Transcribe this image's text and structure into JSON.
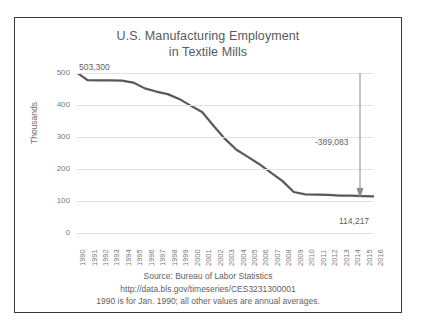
{
  "figure": {
    "title_line_1": "U.S. Manufacturing Employment",
    "title_line_2": "in Textile Mills",
    "border_color": "#3a3a3a",
    "background": "#ffffff"
  },
  "annotations": {
    "start_value_label": "503,300",
    "delta_label": "-389,083",
    "end_value_label": "114,217",
    "arrow_name": "decline-arrow"
  },
  "footnotes": [
    "Source:  Bureau of Labor Statistics",
    "http://data.bls.gov/timeseries/CES3231300001",
    "1990 is for Jan. 1990; all other values are annual averages."
  ],
  "chart_data": {
    "type": "line",
    "title": "U.S. Manufacturing Employment in Textile Mills",
    "xlabel": "",
    "ylabel": "Thousands",
    "ylim": [
      0,
      500
    ],
    "yticks": [
      0,
      100,
      200,
      300,
      400,
      500
    ],
    "ytick_labels": [
      "0",
      "100",
      "200",
      "300",
      "400",
      "500"
    ],
    "grid": true,
    "legend": false,
    "line_color": "#595959",
    "line_width": 2.2,
    "categories": [
      "1990",
      "1991",
      "1992",
      "1993",
      "1994",
      "1995",
      "1996",
      "1997",
      "1998",
      "1999",
      "2000",
      "2001",
      "2002",
      "2003",
      "2004",
      "2005",
      "2006",
      "2007",
      "2008",
      "2009",
      "2010",
      "2011",
      "2012",
      "2013",
      "2014",
      "2015",
      "2016"
    ],
    "values": [
      503.3,
      478.0,
      477.0,
      477.0,
      476.0,
      470.0,
      452.0,
      442.0,
      434.0,
      419.0,
      398.0,
      378.0,
      335.0,
      294.0,
      260.0,
      238.0,
      215.0,
      189.0,
      163.0,
      128.0,
      120.5,
      120.0,
      119.0,
      117.0,
      117.0,
      115.5,
      114.2
    ],
    "annotations": [
      {
        "name": "start-value",
        "text": "503,300",
        "at_category": "1990",
        "value": 503.3
      },
      {
        "name": "end-value",
        "text": "114,217",
        "at_category": "2016",
        "value": 114.217
      },
      {
        "name": "total-change",
        "text": "-389,083",
        "from": 503.3,
        "to": 114.217
      }
    ]
  }
}
